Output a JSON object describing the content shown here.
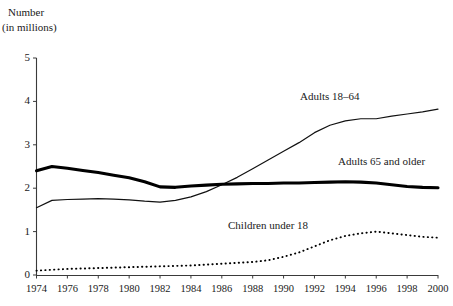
{
  "chart_data": {
    "type": "line",
    "title": "",
    "subtitle": "",
    "xlabel": "",
    "ylabel": "Number",
    "ylabel_line1": "Number",
    "ylabel_line2": "(in millions)",
    "xlim": [
      1974,
      2000
    ],
    "ylim": [
      0,
      5
    ],
    "yticks": [
      "0",
      "1",
      "2",
      "3",
      "4",
      "5"
    ],
    "ytick_values": [
      0,
      1,
      2,
      3,
      4,
      5
    ],
    "xticks": [
      "1974",
      "1976",
      "1978",
      "1980",
      "1982",
      "1984",
      "1986",
      "1988",
      "1990",
      "1992",
      "1994",
      "1996",
      "1998",
      "2000"
    ],
    "xtick_values": [
      1974,
      1976,
      1978,
      1980,
      1982,
      1984,
      1986,
      1988,
      1990,
      1992,
      1994,
      1996,
      1998,
      2000
    ],
    "grid": false,
    "legend_position": "inline-annotations",
    "x": [
      1974,
      1975,
      1976,
      1977,
      1978,
      1979,
      1980,
      1981,
      1982,
      1983,
      1984,
      1985,
      1986,
      1987,
      1988,
      1989,
      1990,
      1991,
      1992,
      1993,
      1994,
      1995,
      1996,
      1997,
      1998,
      1999,
      2000
    ],
    "series": [
      {
        "name": "Adults 18–64",
        "style": "thin-solid",
        "color": "#111111",
        "label_text": "Adults 18–64",
        "values": [
          1.55,
          1.72,
          1.74,
          1.75,
          1.76,
          1.75,
          1.73,
          1.7,
          1.68,
          1.72,
          1.8,
          1.92,
          2.08,
          2.25,
          2.45,
          2.65,
          2.85,
          3.05,
          3.28,
          3.45,
          3.55,
          3.6,
          3.6,
          3.66,
          3.71,
          3.76,
          3.82
        ]
      },
      {
        "name": "Adults 65 and older",
        "style": "thick-solid",
        "color": "#000000",
        "label_text": "Adults 65 and older",
        "values": [
          2.4,
          2.5,
          2.46,
          2.41,
          2.36,
          2.3,
          2.24,
          2.15,
          2.03,
          2.02,
          2.05,
          2.07,
          2.09,
          2.1,
          2.11,
          2.11,
          2.12,
          2.12,
          2.13,
          2.14,
          2.15,
          2.14,
          2.12,
          2.08,
          2.04,
          2.02,
          2.01
        ]
      },
      {
        "name": "Children under 18",
        "style": "dotted",
        "color": "#000000",
        "label_text": "Children under 18",
        "values": [
          0.1,
          0.12,
          0.14,
          0.15,
          0.16,
          0.17,
          0.18,
          0.19,
          0.2,
          0.21,
          0.22,
          0.24,
          0.26,
          0.28,
          0.3,
          0.34,
          0.42,
          0.52,
          0.66,
          0.8,
          0.9,
          0.96,
          1.0,
          0.96,
          0.92,
          0.88,
          0.86
        ]
      }
    ]
  }
}
